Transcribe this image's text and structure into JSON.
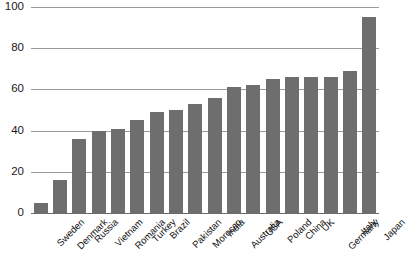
{
  "chart_data": {
    "type": "bar",
    "title": "",
    "subtitle": "",
    "xlabel": "",
    "ylabel": "",
    "ylim": [
      0,
      100
    ],
    "yticks": [
      0,
      20,
      40,
      60,
      80,
      100
    ],
    "grid": true,
    "legend": false,
    "legend_position": "none",
    "orientation": "vertical",
    "bar_color": "#6e6e6e",
    "gridline_color": "#9a9a9a",
    "axis_color": "#6b6b6b",
    "background_color": "#ffffff",
    "categories": [
      "Sweden",
      "Denmark",
      "Russia",
      "Vietnam",
      "Romania",
      "Turkey",
      "Brazil",
      "Pakistan",
      "Morocco",
      "India",
      "Australia",
      "USA",
      "Poland",
      "China",
      "UK",
      "Germany",
      "Italy",
      "Japan"
    ],
    "values": [
      5,
      16,
      36,
      40,
      41,
      45,
      49,
      50,
      53,
      56,
      61,
      62,
      65,
      66,
      66,
      66,
      69,
      95
    ],
    "series": [
      {
        "name": "",
        "values": [
          5,
          16,
          36,
          40,
          41,
          45,
          49,
          50,
          53,
          56,
          61,
          62,
          65,
          66,
          66,
          66,
          69,
          95
        ]
      }
    ]
  }
}
